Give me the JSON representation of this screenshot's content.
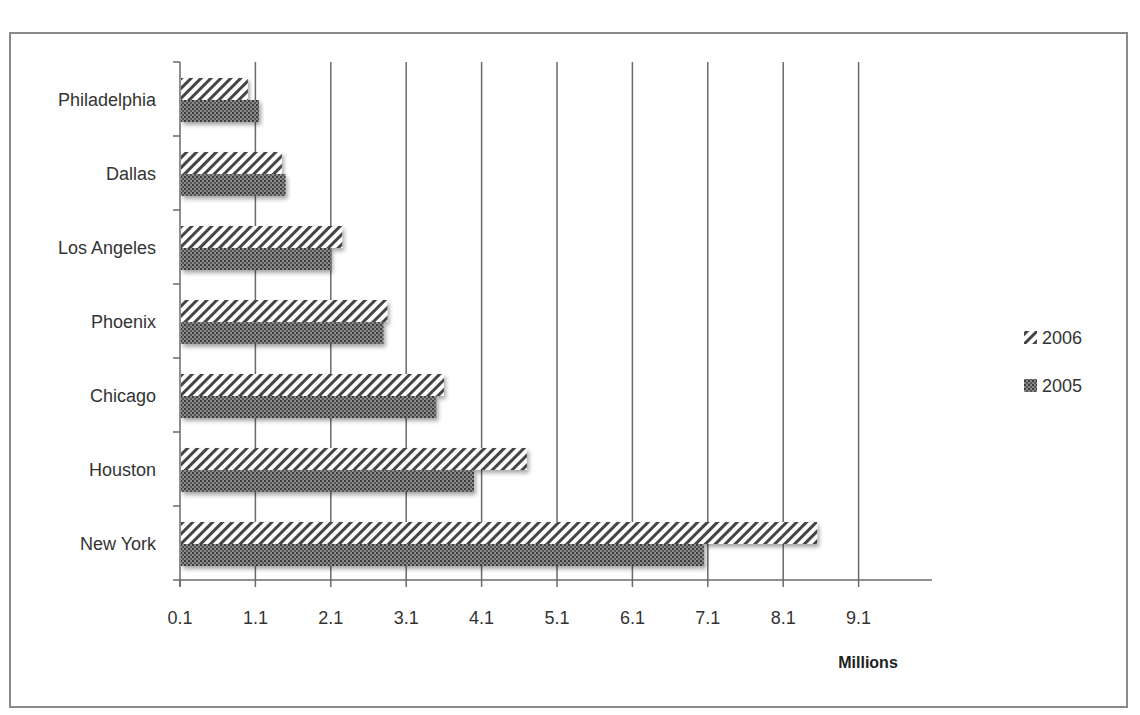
{
  "chart_data": {
    "type": "bar",
    "orientation": "horizontal",
    "title": "",
    "xlabel": "Millions",
    "ylabel": "",
    "categories": [
      "New York",
      "Houston",
      "Chicago",
      "Phoenix",
      "Los Angeles",
      "Dallas",
      "Philadelphia"
    ],
    "series": [
      {
        "name": "2006",
        "pattern": "diagonal-hatch",
        "values": [
          8.55,
          4.7,
          3.6,
          2.85,
          2.25,
          1.45,
          1.0
        ]
      },
      {
        "name": "2005",
        "pattern": "dense-dot",
        "values": [
          7.05,
          4.0,
          3.5,
          2.8,
          2.1,
          1.5,
          1.15
        ]
      }
    ],
    "xticks": [
      "0.1",
      "1.1",
      "2.1",
      "3.1",
      "4.1",
      "5.1",
      "6.1",
      "7.1",
      "8.1",
      "9.1"
    ],
    "xlim": [
      0.1,
      10.0
    ],
    "grid": "vertical",
    "legend_position": "right",
    "legend": [
      {
        "label": "2006",
        "pattern": "diagonal-hatch"
      },
      {
        "label": "2005",
        "pattern": "dense-dot"
      }
    ]
  }
}
